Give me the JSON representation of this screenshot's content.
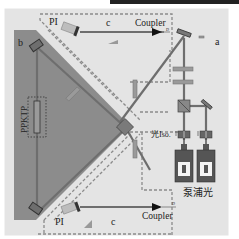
{
  "labels": {
    "pi_top": "PI",
    "c_top": "c",
    "coupler_top": "Coupler",
    "a": "a",
    "b": "b",
    "crystal": "PPKTP",
    "isolator": "光Iso.",
    "pump": "泵浦光",
    "pi_bottom": "PI",
    "c_bottom": "c",
    "coupler_bottom": "Coupler",
    "d_top": "D",
    "d_bottom": "D"
  },
  "colors": {
    "page_bg": "#ffffff",
    "panel_bg": "#e4e4e4",
    "cavity_fill": "#8c8c8c",
    "beam": "#6e6e6e",
    "dashed": "#8a8a8a",
    "component": "#9a9a9a",
    "dark": "#3a3a3a",
    "top_strip": "#222222"
  }
}
